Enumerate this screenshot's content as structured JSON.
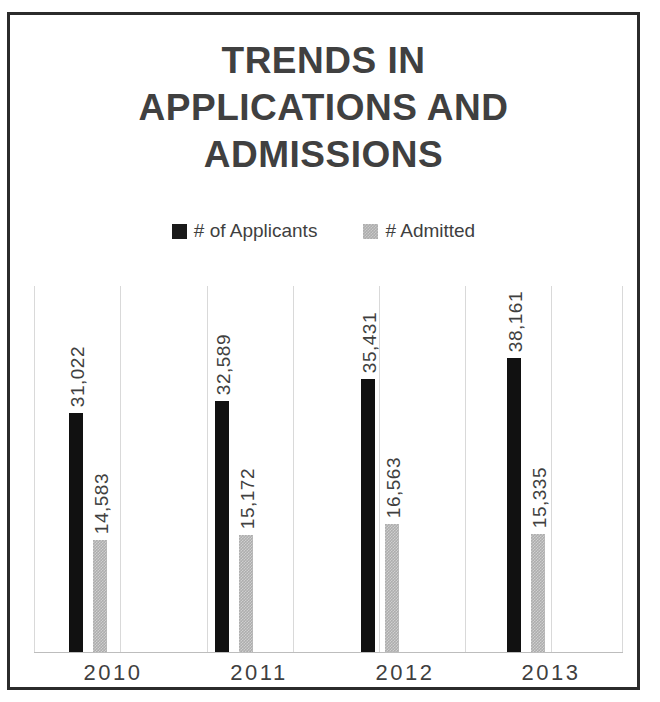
{
  "chart_data": {
    "type": "bar",
    "title": "TRENDS IN\nAPPLICATIONS AND\nADMISSIONS",
    "title_lines": [
      "TRENDS IN",
      "APPLICATIONS AND",
      "ADMISSIONS"
    ],
    "xlabel": "",
    "ylabel": "",
    "categories": [
      "2010",
      "2011",
      "2012",
      "2013"
    ],
    "series": [
      {
        "name": "# of Applicants",
        "color": "#111111",
        "values": [
          31022,
          32589,
          35431,
          38161
        ],
        "labels": [
          "31,022",
          "32,589",
          "35,431",
          "38,161"
        ]
      },
      {
        "name": "# Admitted",
        "color": "#adadad",
        "values": [
          14583,
          15172,
          16563,
          15335
        ],
        "labels": [
          "14,583",
          "15,172",
          "16,563",
          "15,335"
        ]
      }
    ],
    "ylim": [
      0,
      47500
    ],
    "y_axis_visible": false,
    "grid": "vertical",
    "gridline_count": 8,
    "legend_position": "top",
    "data_labels_rotated": true,
    "data_label_orientation": "vertical-bottom-to-top"
  },
  "legend": {
    "entries": [
      {
        "label": "# of Applicants",
        "swatch": "black-square-icon"
      },
      {
        "label": "# Admitted",
        "swatch": "gray-square-icon"
      }
    ]
  },
  "colors": {
    "title": "#404040",
    "text": "#3f3f3f",
    "applicants": "#111111",
    "admitted": "#adadad",
    "gridline": "#d9d9d9",
    "border": "#2b2b2b",
    "background": "#ffffff"
  }
}
